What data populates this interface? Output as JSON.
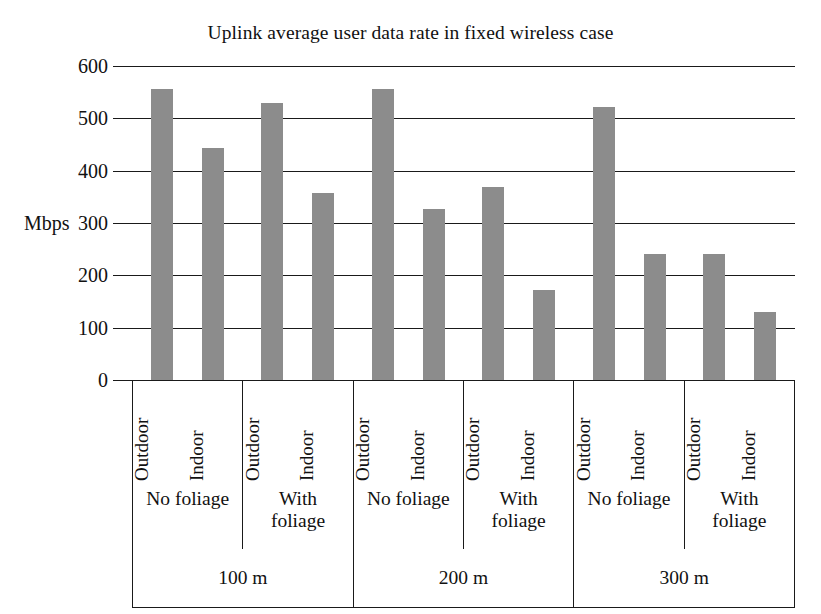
{
  "chart_data": {
    "type": "bar",
    "title": "Uplink average user data rate in fixed wireless case",
    "xlabel": "",
    "ylabel": "Mbps",
    "ylim": [
      0,
      600
    ],
    "yticks": [
      0,
      100,
      200,
      300,
      400,
      500,
      600
    ],
    "ytick_labels": [
      "0",
      "100",
      "200",
      "300",
      "400",
      "500",
      "600"
    ],
    "grid": true,
    "legend": "none",
    "bar_color": "#8c8c8c",
    "axis_color": "#1a1a1a",
    "categories": [
      "100 m / No foliage / Outdoor",
      "100 m / No foliage / Indoor",
      "100 m / With foliage / Outdoor",
      "100 m / With foliage / Indoor",
      "200 m / No foliage / Outdoor",
      "200 m / No foliage / Indoor",
      "200 m / With foliage / Outdoor",
      "200 m / With foliage / Indoor",
      "300 m / No foliage / Outdoor",
      "300 m / No foliage / Indoor",
      "300 m / With foliage / Outdoor",
      "300 m / With foliage / Indoor"
    ],
    "values": [
      556,
      443,
      530,
      357,
      556,
      327,
      368,
      172,
      521,
      240,
      241,
      130
    ],
    "group_levels": {
      "location": [
        "Outdoor",
        "Indoor",
        "Outdoor",
        "Indoor",
        "Outdoor",
        "Indoor",
        "Outdoor",
        "Indoor",
        "Outdoor",
        "Indoor",
        "Outdoor",
        "Indoor"
      ],
      "foliage": [
        "No foliage",
        "With foliage",
        "No foliage",
        "With foliage",
        "No foliage",
        "With foliage"
      ],
      "distance": [
        "100 m",
        "200 m",
        "300 m"
      ]
    }
  },
  "axis": {
    "unit_label": "Mbps"
  }
}
